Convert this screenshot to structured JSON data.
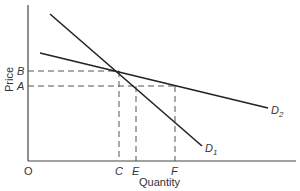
{
  "diagram": {
    "type": "demand-curves",
    "axes": {
      "x_label": "Quantity",
      "y_label": "Price",
      "origin_label": "O"
    },
    "y_ticks": [
      {
        "label": "B",
        "y": 71
      },
      {
        "label": "A",
        "y": 86
      }
    ],
    "x_ticks": [
      {
        "label": "C",
        "x": 119
      },
      {
        "label": "E",
        "x": 136
      },
      {
        "label": "F",
        "x": 175
      }
    ],
    "curves": [
      {
        "name": "D",
        "sub": "1",
        "from": [
          50,
          14
        ],
        "to": [
          202,
          146
        ]
      },
      {
        "name": "D",
        "sub": "2",
        "from": [
          40,
          53
        ],
        "to": [
          268,
          108
        ]
      }
    ],
    "colors": {
      "line": "#222222",
      "axis": "#444444",
      "dash": "#555555"
    }
  }
}
